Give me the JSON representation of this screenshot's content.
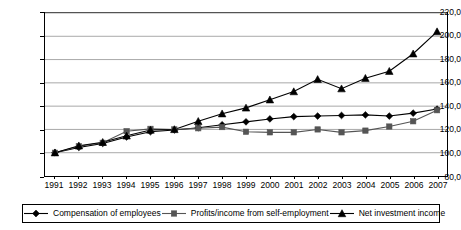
{
  "chart_data": {
    "type": "line",
    "title": "",
    "subtitle": "",
    "xlabel": "",
    "ylabel": "",
    "categories": [
      "1991",
      "1992",
      "1993",
      "1994",
      "1995",
      "1996",
      "1997",
      "1998",
      "1999",
      "2000",
      "2001",
      "2002",
      "2003",
      "2004",
      "2005",
      "2006",
      "2007"
    ],
    "ylim": [
      80.0,
      220.0
    ],
    "yticks": [
      "80,0",
      "100,0",
      "120,0",
      "140,0",
      "160,0",
      "180,0",
      "200,0",
      "220,0"
    ],
    "ytick_values": [
      80,
      100,
      120,
      140,
      160,
      180,
      200,
      220
    ],
    "grid": true,
    "legend_position": "bottom",
    "series": [
      {
        "name": "Compensation of employees",
        "marker": "diamond",
        "color": "#000000",
        "values": [
          100.0,
          104.5,
          108.0,
          113.5,
          118.0,
          119.5,
          121.5,
          124.0,
          126.5,
          129.0,
          131.0,
          131.5,
          132.0,
          132.5,
          131.5,
          134.0,
          137.5
        ]
      },
      {
        "name": "Profits/income from self-employment",
        "marker": "square",
        "color": "#555555",
        "values": [
          100.0,
          105.5,
          108.5,
          118.5,
          120.5,
          120.0,
          121.0,
          122.0,
          118.0,
          117.5,
          117.5,
          120.0,
          117.5,
          119.0,
          122.5,
          127.0,
          136.5
        ]
      },
      {
        "name": "Net investment income",
        "marker": "triangle",
        "color": "#000000",
        "values": [
          100.0,
          106.0,
          109.0,
          114.5,
          119.5,
          120.0,
          127.0,
          133.5,
          138.5,
          145.5,
          152.5,
          163.0,
          155.0,
          164.0,
          170.0,
          185.0,
          200.0
        ]
      }
    ],
    "series_x_override": {
      "Net investment income": [
        1991,
        1992,
        1993,
        1994,
        1995,
        1996,
        1997,
        1998,
        1999,
        2000,
        2001,
        2002,
        2003,
        2004,
        2005,
        2006,
        2007
      ]
    },
    "last_point_extra": {
      "Net investment income": 204.0
    }
  },
  "legend": {
    "items": [
      {
        "label": "Compensation of employees",
        "marker": "diamond"
      },
      {
        "label": "Profits/income from self-employment",
        "marker": "square"
      },
      {
        "label": "Net investment income",
        "marker": "triangle"
      }
    ]
  }
}
